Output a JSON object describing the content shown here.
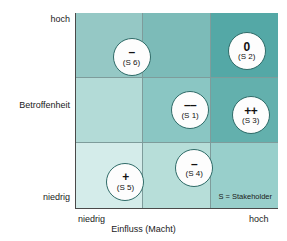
{
  "chart_data": {
    "type": "scatter",
    "title": "",
    "xlabel": "Einfluss (Macht)",
    "ylabel": "Betroffenheit",
    "x_ticks": [
      "niedrig",
      "hoch"
    ],
    "y_ticks": [
      "hoch",
      "niedrig"
    ],
    "grid": true,
    "legend_position": "bottom-right",
    "legend_text": "S = Stakeholder",
    "points": [
      {
        "id": "(S 6)",
        "symbol": "–",
        "symbol_name": "minus",
        "x_pct": 27,
        "y_pct": 22
      },
      {
        "id": "(S 2)",
        "symbol": "0",
        "symbol_name": "zero",
        "x_pct": 84,
        "y_pct": 19
      },
      {
        "id": "(S 1)",
        "symbol": "––",
        "symbol_name": "double-minus",
        "x_pct": 56,
        "y_pct": 49
      },
      {
        "id": "(S 3)",
        "symbol": "++",
        "symbol_name": "double-plus",
        "x_pct": 86,
        "y_pct": 52
      },
      {
        "id": "(S 4)",
        "symbol": "–",
        "symbol_name": "minus",
        "x_pct": 58,
        "y_pct": 79
      },
      {
        "id": "(S 5)",
        "symbol": "+",
        "symbol_name": "plus",
        "x_pct": 24,
        "y_pct": 86
      }
    ],
    "cells": [
      {
        "row": 1,
        "col": 1,
        "color": "#95c8c5"
      },
      {
        "row": 1,
        "col": 2,
        "color": "#7cbbb8"
      },
      {
        "row": 1,
        "col": 3,
        "color": "#54a8a6"
      },
      {
        "row": 2,
        "col": 1,
        "color": "#b3dbd7"
      },
      {
        "row": 2,
        "col": 2,
        "color": "#8ac6c3"
      },
      {
        "row": 2,
        "col": 3,
        "color": "#63b0ad"
      },
      {
        "row": 3,
        "col": 1,
        "color": "#d4ecea"
      },
      {
        "row": 3,
        "col": 2,
        "color": "#b7ded9"
      },
      {
        "row": 3,
        "col": 3,
        "color": "#98cfcb"
      }
    ]
  },
  "axes": {
    "y_high": "hoch",
    "y_label": "Betroffenheit",
    "y_low": "niedrig",
    "x_low": "niedrig",
    "x_label": "Einfluss (Macht)",
    "x_high": "hoch"
  },
  "legend": {
    "text": "S = Stakeholder"
  }
}
